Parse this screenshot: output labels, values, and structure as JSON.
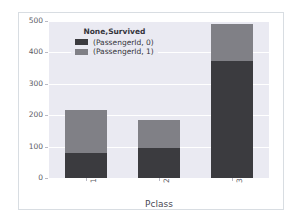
{
  "chart_data": {
    "type": "bar",
    "subtype": "stacked-bar",
    "title": "",
    "xlabel": "Pclass",
    "ylabel": "",
    "categories": [
      "1",
      "2",
      "3"
    ],
    "series": [
      {
        "name": "(PassengerId, 0)",
        "values": [
          80,
          97,
          372
        ],
        "color": "#3b3b3f"
      },
      {
        "name": "(PassengerId, 1)",
        "values": [
          136,
          87,
          119
        ],
        "color": "#808086"
      }
    ],
    "totals": [
      216,
      184,
      491
    ],
    "ylim": [
      0,
      500
    ],
    "yticks": [
      0,
      100,
      200,
      300,
      400,
      500
    ],
    "ytick_labels": [
      "0",
      "100",
      "200",
      "300",
      "400",
      "500"
    ],
    "xtick_labels": [
      "1",
      "2",
      "3"
    ],
    "grid": true,
    "legend": {
      "title": "None,Survived",
      "position": "upper-left",
      "entries": [
        {
          "label": "(PassengerId, 0)",
          "color": "#3b3b3f"
        },
        {
          "label": "(PassengerId, 1)",
          "color": "#808086"
        }
      ]
    },
    "style": {
      "plot_background": "#eaeaf2",
      "figure_background": "#ffffff",
      "gridline_color": "#ffffff",
      "tick_label_color": "#5d5d66",
      "axis_label_color": "#4a4a55"
    }
  }
}
